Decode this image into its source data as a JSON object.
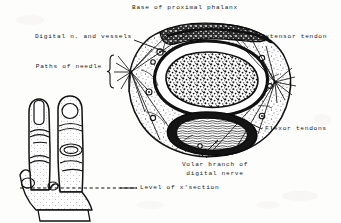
{
  "figure": {
    "title": "Base of proximal phalanx",
    "type": "anatomical-cross-section-illustration",
    "ink_color": "#111111",
    "paper_color": "#fdfdfc"
  },
  "labels": {
    "title": "Base of proximal phalanx",
    "digital_nerve_vessels": "Digital n. and vessels",
    "paths_of_needle": "Paths of needle",
    "extensor_tendon": "Extensor tendon",
    "flexor_tendons": "Flexor tendons",
    "volar_branch_line1": "Volar branch of",
    "volar_branch_line2": "digital nerve",
    "level_of_section": "Level of x'section"
  },
  "structures": {
    "bone": "proximal phalanx bone (cancellous, stippled)",
    "flexor_mass": "flexor tendon bundle",
    "extensor_hood": "extensor tendon over dorsum",
    "skin_envelope": "subcutaneous fat and skin",
    "needle_entry_left": "lateral needle entry point, left",
    "needle_entry_right": "lateral needle entry point, right"
  },
  "finger_diagram": {
    "description": "two adjacent fingers, frontal view",
    "section_marker": "dashed line across finger base indicating level of cross section"
  }
}
